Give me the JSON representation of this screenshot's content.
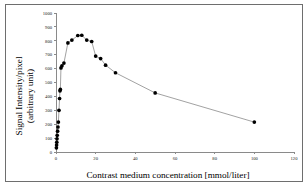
{
  "figure": {
    "background_color": "#ffffff",
    "border_color": "#6e6e6e",
    "axis_color": "#8a8a8a",
    "marker_color": "#000000",
    "line_color": "#8a8a8a"
  },
  "chart_data": {
    "type": "line",
    "title": "",
    "subtitle": "",
    "xlabel": "Contrast medium concentration [mmol/liter]",
    "ylabel_line1": "Signal Intensity/pixel",
    "ylabel_line2": "(arbitrary unit)",
    "ylabel": "Signal Intensity/pixel (arbitrary unit)",
    "xlim": [
      0,
      120
    ],
    "ylim": [
      0,
      1000
    ],
    "xticks": [
      0,
      20,
      40,
      60,
      80,
      100,
      120
    ],
    "xticklabels": [
      "0",
      "20",
      "40",
      "60",
      "80",
      "100",
      "120"
    ],
    "yticks": [
      0,
      100,
      200,
      300,
      400,
      500,
      600,
      700,
      800,
      900,
      1000
    ],
    "yticklabels": [
      "0",
      "100",
      "200",
      "300",
      "400",
      "500",
      "600",
      "700",
      "800",
      "900",
      "1000"
    ],
    "grid": false,
    "legend": false,
    "legend_position": "none",
    "marker": "filled-circle",
    "series": [
      {
        "name": "Signal intensity",
        "x": [
          0.2,
          0.3,
          0.4,
          0.5,
          0.6,
          0.8,
          1.0,
          1.2,
          1.5,
          1.8,
          2.0,
          2.2,
          2.5,
          3.0,
          4.0,
          6.0,
          8.0,
          11.0,
          13.0,
          15.5,
          18.0,
          20.0,
          22.5,
          25.0,
          30.0,
          50.0,
          100.0
        ],
        "y": [
          30,
          50,
          70,
          95,
          120,
          150,
          180,
          215,
          300,
          385,
          440,
          450,
          605,
          620,
          640,
          785,
          805,
          838,
          840,
          805,
          795,
          690,
          672,
          625,
          570,
          425,
          215
        ]
      }
    ]
  }
}
